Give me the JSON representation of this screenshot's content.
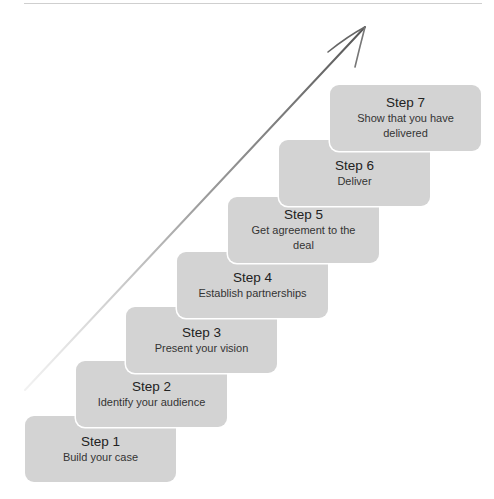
{
  "diagram": {
    "type": "staircase-process",
    "box_color": "#d3d3d3",
    "text_color": "#222222",
    "arrow_color": "#555555",
    "steps": [
      {
        "title": "Step 1",
        "desc": "Build your case"
      },
      {
        "title": "Step 2",
        "desc": "Identify your audience"
      },
      {
        "title": "Step 3",
        "desc": "Present your vision"
      },
      {
        "title": "Step 4",
        "desc": "Establish partnerships"
      },
      {
        "title": "Step 5",
        "desc": "Get agreement to the deal"
      },
      {
        "title": "Step 6",
        "desc": "Deliver"
      },
      {
        "title": "Step 7",
        "desc": "Show that you have delivered"
      }
    ]
  }
}
